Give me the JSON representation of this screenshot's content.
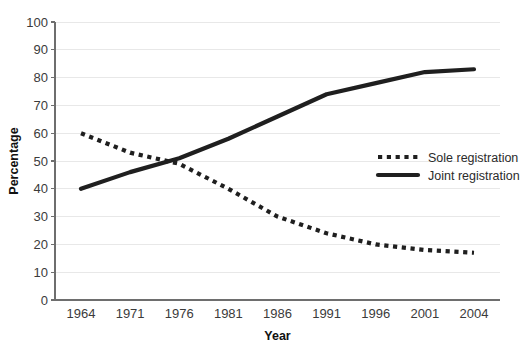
{
  "chart_data": {
    "type": "line",
    "title": "",
    "xlabel": "Year",
    "ylabel": "Percentage",
    "categories": [
      "1964",
      "1971",
      "1976",
      "1981",
      "1986",
      "1991",
      "1996",
      "2001",
      "2004"
    ],
    "ylim": [
      0,
      100
    ],
    "yticks": [
      0,
      10,
      20,
      30,
      40,
      50,
      60,
      70,
      80,
      90,
      100
    ],
    "ytick_labels": [
      "0",
      "10",
      "20",
      "30",
      "40",
      "50",
      "60",
      "70",
      "80",
      "90",
      "100"
    ],
    "grid": true,
    "grid_axis": "y",
    "legend_position": "center-right",
    "series": [
      {
        "name": "Sole registration",
        "style": "dotted",
        "color": "#1f1f1f",
        "values": [
          60,
          53,
          49,
          40,
          30,
          24,
          20,
          18,
          17
        ]
      },
      {
        "name": "Joint registration",
        "style": "solid",
        "color": "#1f1f1f",
        "values": [
          40,
          46,
          51,
          58,
          66,
          74,
          78,
          82,
          83
        ]
      }
    ]
  },
  "axes": {
    "y_title": "Percentage",
    "x_title": "Year"
  },
  "legend": {
    "items": [
      {
        "label": "Sole registration",
        "style": "dotted"
      },
      {
        "label": "Joint registration",
        "style": "solid"
      }
    ]
  },
  "colors": {
    "series": "#1f1f1f",
    "gridline": "#e8e8e8",
    "axis": "#6e6e6e",
    "tick_text": "#3b3b3b",
    "title_text": "#111111",
    "background": "#ffffff"
  },
  "geometry": {
    "plot_left": 55,
    "plot_right": 500,
    "plot_top": 22,
    "plot_bottom": 300,
    "x_first": 81,
    "x_last": 474,
    "legend_x": 378,
    "legend_y_first": 157,
    "legend_row_gap": 18,
    "legend_swatch_width": 40
  }
}
